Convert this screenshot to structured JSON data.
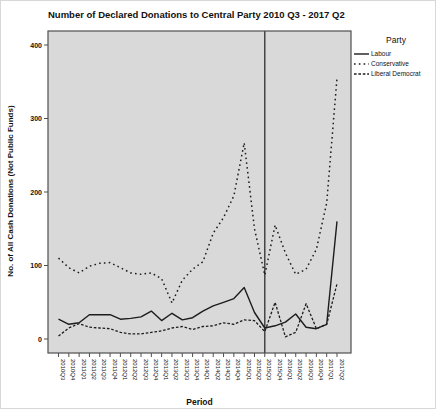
{
  "chart_data": {
    "type": "line",
    "title": "Number of Declared Donations to Central Party 2010 Q3 - 2017 Q2",
    "xlabel": "Period",
    "ylabel": "No. of All Cash Donations (Not Public Funds)",
    "ylim": [
      0,
      400
    ],
    "yticks": [
      0,
      100,
      200,
      300,
      400
    ],
    "grid": false,
    "legend_position": "top-right",
    "categories": [
      "2010Q3",
      "2010Q4",
      "2011Q1",
      "2011Q2",
      "2011Q3",
      "2011Q4",
      "2012Q1",
      "2012Q2",
      "2012Q3",
      "2012Q4",
      "2013Q1",
      "2013Q2",
      "2013Q3",
      "2013Q4",
      "2014Q1",
      "2014Q2",
      "2014Q3",
      "2014Q4",
      "2015Q1",
      "2015Q2",
      "2015Q3",
      "2015Q4",
      "2016Q1",
      "2016Q2",
      "2016Q3",
      "2016Q4",
      "2017Q1",
      "2017Q2"
    ],
    "series": [
      {
        "name": "Labour",
        "style": "solid",
        "values": [
          27,
          20,
          22,
          33,
          33,
          33,
          27,
          28,
          30,
          38,
          25,
          35,
          26,
          29,
          38,
          45,
          50,
          55,
          70,
          36,
          15,
          18,
          23,
          34,
          16,
          14,
          20,
          160
        ]
      },
      {
        "name": "Conservative",
        "style": "dotted-spaced",
        "values": [
          110,
          97,
          90,
          99,
          103,
          104,
          97,
          90,
          88,
          90,
          82,
          49,
          80,
          95,
          105,
          144,
          165,
          195,
          267,
          150,
          87,
          155,
          117,
          88,
          95,
          122,
          185,
          355
        ]
      },
      {
        "name": "Liberal Democrat",
        "style": "dotted-dense",
        "values": [
          4,
          15,
          21,
          16,
          15,
          14,
          9,
          7,
          7,
          9,
          11,
          15,
          17,
          13,
          17,
          18,
          22,
          20,
          26,
          25,
          10,
          50,
          3,
          9,
          48,
          14,
          20,
          75
        ]
      }
    ],
    "reference_line": {
      "category": "2015Q3"
    },
    "legend": {
      "title": "Party"
    },
    "colors": {
      "line": "#1c1c1c",
      "plot_bg": "#d9d9d9",
      "frame": "#4f4f4f",
      "reference": "#2e2e2e",
      "text": "#111111"
    }
  }
}
